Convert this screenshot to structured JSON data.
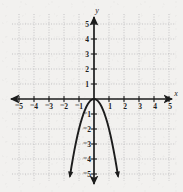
{
  "figure": {
    "kind": "coordinate-plane-parabola",
    "background_color": "#f2f1ef",
    "ink_color": "#1c1c1c",
    "grid_color": "#b9b9bb"
  },
  "axes": {
    "x_axis_label": "x",
    "y_axis_label": "y",
    "x_ticks": [
      "⁻5",
      "⁻4",
      "⁻3",
      "⁻2",
      "⁻1",
      "1",
      "2",
      "3",
      "4",
      "5"
    ],
    "y_ticks": [
      "5",
      "4",
      "3",
      "2",
      "1",
      "⁻1",
      "⁻2",
      "⁻3",
      "⁻4",
      "⁻5"
    ],
    "x_range": [
      -5.6,
      5.6
    ],
    "y_range": [
      -5.6,
      5.9
    ],
    "grid": "on",
    "grid_style": "dotted",
    "grid_step": 1
  },
  "chart_data": {
    "type": "line",
    "title": "",
    "xlabel": "x",
    "ylabel": "y",
    "xlim": [
      -5.6,
      5.6
    ],
    "ylim": [
      -5.6,
      5.9
    ],
    "grid": true,
    "legend": "none",
    "series": [
      {
        "name": "parabola",
        "equation": "y = -2x^2",
        "direction": "opens-downward",
        "vertex": [
          0,
          0
        ],
        "x": [
          -1.6,
          -1.5,
          -1.4,
          -1.3,
          -1.2,
          -1.1,
          -1.0,
          -0.9,
          -0.8,
          -0.7,
          -0.6,
          -0.5,
          -0.4,
          -0.3,
          -0.2,
          -0.1,
          0,
          0.1,
          0.2,
          0.3,
          0.4,
          0.5,
          0.6,
          0.7,
          0.8,
          0.9,
          1.0,
          1.1,
          1.2,
          1.3,
          1.4,
          1.5,
          1.6
        ],
        "y": [
          -5.12,
          -4.5,
          -3.92,
          -3.38,
          -2.88,
          -2.42,
          -2.0,
          -1.62,
          -1.28,
          -0.98,
          -0.72,
          -0.5,
          -0.32,
          -0.18,
          -0.08,
          -0.02,
          0,
          -0.02,
          -0.08,
          -0.18,
          -0.32,
          -0.5,
          -0.72,
          -0.98,
          -1.28,
          -1.62,
          -2.0,
          -2.42,
          -2.88,
          -3.38,
          -3.92,
          -4.5,
          -5.12
        ],
        "endpoints_have_arrows": true
      }
    ]
  }
}
